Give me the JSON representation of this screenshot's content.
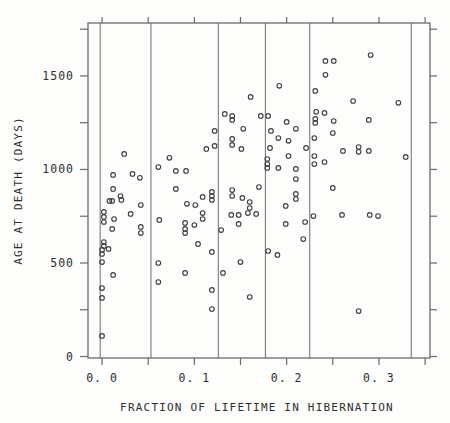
{
  "chart_data": {
    "type": "scatter",
    "title": "",
    "xlabel": "FRACTION OF LIFETIME IN HIBERNATION",
    "ylabel": "AGE AT DEATH (DAYS)",
    "xlim": [
      -0.0152,
      0.3553
    ],
    "ylim": [
      -8,
      1783
    ],
    "x_major_ticks": [
      0.0,
      0.1,
      0.2,
      0.3
    ],
    "x_tick_labels": [
      "0. 0",
      "0. 1",
      "0. 2",
      "0. 3"
    ],
    "x_minor_ticks": [
      0.05,
      0.15,
      0.25,
      0.35
    ],
    "y_major_ticks": [
      0,
      500,
      1000,
      1500
    ],
    "y_tick_labels": [
      "0",
      "500",
      "1000",
      "1500"
    ],
    "y_minor_ticks": [
      250,
      750,
      1250,
      1750
    ],
    "vlines": [
      -0.002,
      0.053,
      0.126,
      0.177,
      0.225,
      0.335
    ],
    "grid": "vertical-reference-lines-only",
    "legend": "none",
    "marker": "open-circle",
    "marker_color": "#3d3d3d",
    "frame_color": "#6a6a6a",
    "points": [
      [
        0.161,
        1388
      ],
      [
        0.192,
        1447
      ],
      [
        0.133,
        1297
      ],
      [
        0.141,
        1286
      ],
      [
        0.141,
        1265
      ],
      [
        0.153,
        1217
      ],
      [
        0.122,
        1206
      ],
      [
        0.172,
        1286
      ],
      [
        0.18,
        1286
      ],
      [
        0.183,
        1206
      ],
      [
        0.2,
        1254
      ],
      [
        0.21,
        1217
      ],
      [
        0.231,
        1420
      ],
      [
        0.232,
        1308
      ],
      [
        0.231,
        1270
      ],
      [
        0.231,
        1249
      ],
      [
        0.242,
        1580
      ],
      [
        0.251,
        1580
      ],
      [
        0.242,
        1506
      ],
      [
        0.291,
        1612
      ],
      [
        0.272,
        1366
      ],
      [
        0.321,
        1356
      ],
      [
        0.241,
        1302
      ],
      [
        0.251,
        1259
      ],
      [
        0.289,
        1265
      ],
      [
        0.25,
        1195
      ],
      [
        0.024,
        1083
      ],
      [
        0.012,
        971
      ],
      [
        0.033,
        976
      ],
      [
        0.041,
        955
      ],
      [
        0.012,
        896
      ],
      [
        0.02,
        858
      ],
      [
        0.021,
        837
      ],
      [
        0.008,
        832
      ],
      [
        0.011,
        832
      ],
      [
        0.042,
        810
      ],
      [
        0.031,
        762
      ],
      [
        0.002,
        773
      ],
      [
        0.002,
        746
      ],
      [
        0.002,
        719
      ],
      [
        0.013,
        735
      ],
      [
        0.011,
        682
      ],
      [
        0.042,
        693
      ],
      [
        0.042,
        660
      ],
      [
        0.002,
        612
      ],
      [
        0.002,
        591
      ],
      [
        0.061,
        1013
      ],
      [
        0.073,
        1062
      ],
      [
        0.08,
        992
      ],
      [
        0.091,
        992
      ],
      [
        0.08,
        896
      ],
      [
        0.092,
        816
      ],
      [
        0.101,
        810
      ],
      [
        0.062,
        730
      ],
      [
        0.09,
        714
      ],
      [
        0.1,
        703
      ],
      [
        0.09,
        682
      ],
      [
        0.09,
        660
      ],
      [
        0.104,
        602
      ],
      [
        0.113,
        1110
      ],
      [
        0.122,
        1126
      ],
      [
        0.109,
        853
      ],
      [
        0.119,
        880
      ],
      [
        0.119,
        858
      ],
      [
        0.119,
        837
      ],
      [
        0.109,
        767
      ],
      [
        0.109,
        735
      ],
      [
        0.129,
        676
      ],
      [
        0.141,
        1163
      ],
      [
        0.141,
        1131
      ],
      [
        0.151,
        1110
      ],
      [
        0.141,
        890
      ],
      [
        0.141,
        858
      ],
      [
        0.152,
        848
      ],
      [
        0.16,
        826
      ],
      [
        0.16,
        794
      ],
      [
        0.14,
        757
      ],
      [
        0.148,
        757
      ],
      [
        0.158,
        767
      ],
      [
        0.167,
        762
      ],
      [
        0.148,
        709
      ],
      [
        0.17,
        906
      ],
      [
        0.182,
        1115
      ],
      [
        0.179,
        1056
      ],
      [
        0.179,
        1029
      ],
      [
        0.179,
        1008
      ],
      [
        0.191,
        1008
      ],
      [
        0.191,
        1168
      ],
      [
        0.202,
        1153
      ],
      [
        0.202,
        1072
      ],
      [
        0.21,
        1003
      ],
      [
        0.21,
        949
      ],
      [
        0.21,
        869
      ],
      [
        0.21,
        842
      ],
      [
        0.199,
        805
      ],
      [
        0.199,
        709
      ],
      [
        0.22,
        719
      ],
      [
        0.218,
        628
      ],
      [
        0.221,
        1115
      ],
      [
        0.23,
        1168
      ],
      [
        0.23,
        1072
      ],
      [
        0.23,
        1029
      ],
      [
        0.229,
        751
      ],
      [
        0.261,
        1099
      ],
      [
        0.278,
        1120
      ],
      [
        0.278,
        1094
      ],
      [
        0.289,
        1099
      ],
      [
        0.329,
        1067
      ],
      [
        0.241,
        1040
      ],
      [
        0.25,
        901
      ],
      [
        0.26,
        757
      ],
      [
        0.29,
        757
      ],
      [
        0.299,
        751
      ],
      [
        0.0,
        570
      ],
      [
        0.0,
        548
      ],
      [
        0.007,
        575
      ],
      [
        0.0,
        505
      ],
      [
        0.012,
        436
      ],
      [
        0.0,
        366
      ],
      [
        0.0,
        313
      ],
      [
        0.0,
        110
      ],
      [
        0.061,
        500
      ],
      [
        0.09,
        447
      ],
      [
        0.061,
        398
      ],
      [
        0.119,
        559
      ],
      [
        0.15,
        505
      ],
      [
        0.131,
        447
      ],
      [
        0.119,
        356
      ],
      [
        0.16,
        318
      ],
      [
        0.119,
        254
      ],
      [
        0.18,
        564
      ],
      [
        0.19,
        543
      ],
      [
        0.278,
        243
      ]
    ]
  }
}
